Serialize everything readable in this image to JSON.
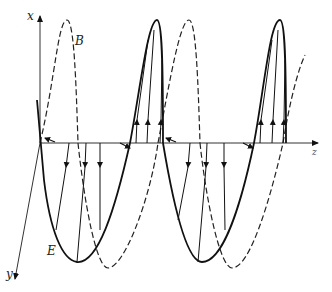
{
  "diagram": {
    "title": "",
    "colors": {
      "ink": "#111111",
      "background": "#ffffff"
    },
    "axes": {
      "x_label": "x",
      "y_label": "y",
      "z_label": "z"
    },
    "curve_labels": {
      "B": "B",
      "E": "E"
    },
    "legend": [
      {
        "name": "E",
        "style": "solid"
      },
      {
        "name": "B",
        "style": "dashed"
      }
    ]
  }
}
